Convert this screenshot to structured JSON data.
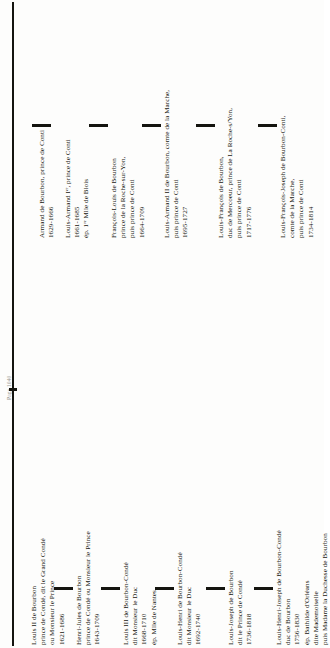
{
  "page": {
    "running_head": "Page 1040",
    "orientation": "rotated-90",
    "spine_color": "#14140f"
  },
  "conti_branch": {
    "label": "Branche de Conti",
    "entries": [
      {
        "name": "armand-de-bourbon",
        "lines": [
          "Armand de Bourbon, prince de Conti",
          "1629-1666"
        ]
      },
      {
        "name": "louis-armand-i",
        "lines": [
          "Louis-Armand Iᵉʳ, prince de Conti",
          "1661-1685",
          "ép. 1ʳᵉ Mlle de Blois"
        ]
      },
      {
        "name": "francois-louis-de-bourbon",
        "lines": [
          "François-Louis de Bourbon",
          "prince de la Roche-sur-Yon,",
          "puis prince de Conti",
          "1664-1709"
        ]
      },
      {
        "name": "louis-armand-ii",
        "lines": [
          "Louis-Armand II de Bourbon, comte de la Marche,",
          "puis prince de Conti",
          "1695-1727"
        ]
      },
      {
        "name": "louis-francois-de-bourbon",
        "lines": [
          "Louis-François de Bourbon,",
          "duc de Mercoeur, prince de La Roche-s/Yon,",
          "puis prince de Conti",
          "1717-1776"
        ]
      },
      {
        "name": "louis-francois-joseph",
        "lines": [
          "Louis-François-Joseph de Bourbon-Conti,",
          "comte de la Marche,",
          "puis prince de Conti",
          "1734-1814"
        ]
      }
    ]
  },
  "conde_branch": {
    "label": "Branche de Condé",
    "entries": [
      {
        "name": "louis-ii-de-bourbon",
        "lines": [
          "Louis II de Bourbon",
          "prince de Condé, dit le Grand Condé",
          "ou Monsieur le Prince",
          "1621-1686"
        ]
      },
      {
        "name": "henri-jules-de-bourbon",
        "lines": [
          "Henri-Jules de Bourbon",
          "prince de Condé ou Monsieur le Prince",
          "1643-1709"
        ]
      },
      {
        "name": "louis-iii-de-bourbon-conde",
        "lines": [
          "Louis III de Bourbon-Condé",
          "dit Monsieur le Duc",
          "1668-1710",
          "ép. Mlle de Nantes"
        ]
      },
      {
        "name": "louis-henri-de-bourbon-conde",
        "lines": [
          "Louis-Henri de Bourbon-Condé",
          "dit Monsieur le Duc",
          "1692-1740"
        ]
      },
      {
        "name": "louis-joseph-de-bourbon",
        "lines": [
          "Louis-Joseph de Bourbon",
          "dit le Prince de Condé",
          "1736-1818"
        ]
      },
      {
        "name": "louis-henri-joseph-de-bourbon-conde",
        "lines": [
          "Louis-Henri-Joseph de Bourbon-Condé",
          "duc de Bourbon",
          "1756-1830",
          "ép. Bathilde d'Orléans",
          "dite Mademoiselle",
          "puis Madame la Duchesse de Bourbon"
        ]
      }
    ]
  }
}
